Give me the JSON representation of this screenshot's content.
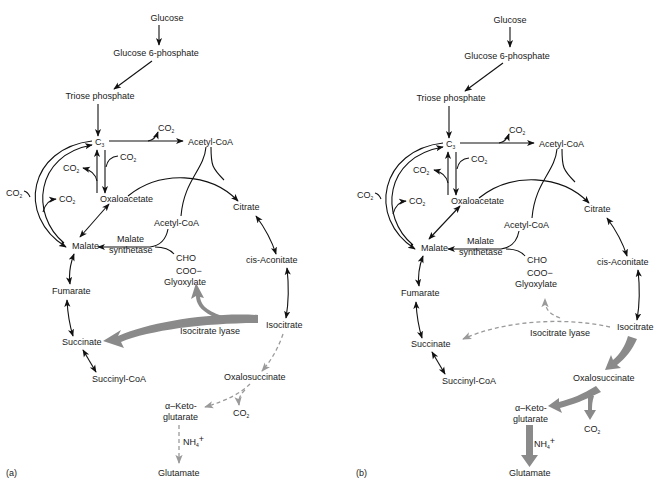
{
  "figure": {
    "panels": [
      {
        "id": "a",
        "label": "(a)",
        "nodes": {
          "glucose": "Glucose",
          "g6p": "Glucose 6-phosphate",
          "triose": "Triose phosphate",
          "c3": "C",
          "c3_sub": "3",
          "co2": "CO",
          "co2_sub": "2",
          "acetyl_coa_top": "Acetyl-CoA",
          "oxaloacetate": "Oxaloacetate",
          "citrate": "Citrate",
          "acetyl_coa_mid": "Acetyl-CoA",
          "malate": "Malate",
          "malate_synthetase_1": "Malate",
          "malate_synthetase_2": "synthetase",
          "cho": "CHO",
          "coo": "COO−",
          "glyoxylate": "Glyoxylate",
          "cis_aconitate": "cis-Aconitate",
          "fumarate": "Fumarate",
          "isocitrate": "Isocitrate",
          "isocitrate_lyase": "Isocitrate lyase",
          "succinate": "Succinate",
          "succinyl_coa": "Succinyl-CoA",
          "oxalosuccinate": "Oxalosuccinate",
          "aketo_1": "α–Keto-",
          "aketo_2": "glutarate",
          "nh4": "NH",
          "nh4_sub": "4",
          "nh4_sup": "+",
          "glutamate": "Glutamate"
        },
        "emphasis": "glyoxylate-cycle (isocitrate lyase thick arrow); TCA to glutamate dashed"
      },
      {
        "id": "b",
        "label": "(b)",
        "nodes": {
          "glucose": "Glucose",
          "g6p": "Glucose 6-phosphate",
          "triose": "Triose phosphate",
          "c3": "C",
          "c3_sub": "3",
          "co2": "CO",
          "co2_sub": "2",
          "acetyl_coa_top": "Acetyl-CoA",
          "oxaloacetate": "Oxaloacetate",
          "citrate": "Citrate",
          "acetyl_coa_mid": "Acetyl-CoA",
          "malate": "Malate",
          "malate_synthetase_1": "Malate",
          "malate_synthetase_2": "synthetase",
          "cho": "CHO",
          "coo": "COO−",
          "glyoxylate": "Glyoxylate",
          "cis_aconitate": "cis-Aconitate",
          "fumarate": "Fumarate",
          "isocitrate": "Isocitrate",
          "isocitrate_lyase": "Isocitrate lyase",
          "succinate": "Succinate",
          "succinyl_coa": "Succinyl-CoA",
          "oxalosuccinate": "Oxalosuccinate",
          "aketo_1": "α–Keto-",
          "aketo_2": "glutarate",
          "nh4": "NH",
          "nh4_sub": "4",
          "nh4_sup": "+",
          "glutamate": "Glutamate"
        },
        "emphasis": "TCA to glutamate thick arrows; isocitrate lyase dashed"
      }
    ],
    "colors": {
      "line": "#111111",
      "emphasis_arrow": "#8a8a8a",
      "dashed_arrow": "#9a9a9a",
      "background": "#ffffff"
    }
  }
}
